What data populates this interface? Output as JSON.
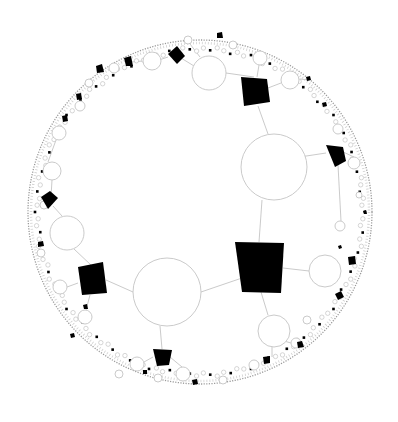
{
  "diagram": {
    "type": "hyperbolic-tree",
    "disk": {
      "cx": 200,
      "cy": 212,
      "r": 172
    },
    "colors": {
      "edge": "#bdbdbd",
      "circle_stroke": "#c4c4c4",
      "square_fill": "#000000",
      "background": "#ffffff"
    },
    "circles": [
      {
        "id": "c-main-center",
        "x": 167,
        "y": 292,
        "r": 34
      },
      {
        "id": "c-main-upper",
        "x": 274,
        "y": 167,
        "r": 33
      },
      {
        "id": "c-left",
        "x": 67,
        "y": 233,
        "r": 17
      },
      {
        "id": "c-right",
        "x": 325,
        "y": 271,
        "r": 16
      },
      {
        "id": "c-bottom-right",
        "x": 274,
        "y": 331,
        "r": 16
      },
      {
        "id": "c-top",
        "x": 209,
        "y": 73,
        "r": 17
      },
      {
        "id": "c-top-left",
        "x": 152,
        "y": 61,
        "r": 9
      },
      {
        "id": "c-top-right",
        "x": 290,
        "y": 80,
        "r": 9
      },
      {
        "id": "c-top-right2",
        "x": 260,
        "y": 58,
        "r": 7
      },
      {
        "id": "c-left-mid",
        "x": 52,
        "y": 171,
        "r": 9
      },
      {
        "id": "c-left-top",
        "x": 59,
        "y": 133,
        "r": 7
      },
      {
        "id": "c-left-low",
        "x": 60,
        "y": 287,
        "r": 7
      },
      {
        "id": "c-left-low2",
        "x": 85,
        "y": 317,
        "r": 7
      },
      {
        "id": "c-bot-left",
        "x": 137,
        "y": 364,
        "r": 7
      },
      {
        "id": "c-bot-mid",
        "x": 183,
        "y": 374,
        "r": 7
      },
      {
        "id": "c-right-up",
        "x": 354,
        "y": 163,
        "r": 6
      },
      {
        "id": "c-right-low",
        "x": 340,
        "y": 226,
        "r": 5
      },
      {
        "id": "c-r-a",
        "x": 338,
        "y": 129,
        "r": 5
      },
      {
        "id": "c-r-b",
        "x": 296,
        "y": 343,
        "r": 5
      },
      {
        "id": "c-r-c",
        "x": 254,
        "y": 365,
        "r": 5
      },
      {
        "id": "c-t-a",
        "x": 114,
        "y": 68,
        "r": 5
      },
      {
        "id": "c-t-b",
        "x": 89,
        "y": 83,
        "r": 4
      },
      {
        "id": "c-t-c",
        "x": 80,
        "y": 106,
        "r": 5
      },
      {
        "id": "c-t-d",
        "x": 188,
        "y": 40,
        "r": 4
      },
      {
        "id": "c-t-e",
        "x": 233,
        "y": 45,
        "r": 4
      },
      {
        "id": "c-l-a",
        "x": 44,
        "y": 205,
        "r": 4
      },
      {
        "id": "c-l-b",
        "x": 41,
        "y": 253,
        "r": 4
      },
      {
        "id": "c-b-a",
        "x": 119,
        "y": 374,
        "r": 4
      },
      {
        "id": "c-b-b",
        "x": 158,
        "y": 378,
        "r": 4
      },
      {
        "id": "c-b-c",
        "x": 223,
        "y": 380,
        "r": 4
      },
      {
        "id": "c-b-d",
        "x": 307,
        "y": 320,
        "r": 4
      },
      {
        "id": "c-r-d",
        "x": 359,
        "y": 195,
        "r": 3
      }
    ],
    "squares": [
      {
        "id": "sq-center",
        "points": "235,242 284,243 281,293 242,292"
      },
      {
        "id": "sq-top",
        "points": "241,77 267,79 270,102 244,106"
      },
      {
        "id": "sq-left",
        "points": "78,267 103,262 107,293 82,295"
      },
      {
        "id": "sq-right-up",
        "points": "326,145 343,147 346,161 335,167"
      },
      {
        "id": "sq-bottom",
        "points": "153,349 172,350 169,365 157,366"
      },
      {
        "id": "sq-top-left",
        "points": "168,54 177,46 185,56 177,64"
      },
      {
        "id": "sq-left-top",
        "points": "41,197 50,191 58,198 48,209"
      },
      {
        "id": "sq-top-mid",
        "points": "124,58 131,56 133,66 126,66"
      },
      {
        "id": "sq-t-a",
        "points": "96,66 102,64 104,72 97,73"
      },
      {
        "id": "sq-t-b",
        "points": "76,94 81,93 82,99 77,100"
      },
      {
        "id": "sq-t-c",
        "points": "62,116 67,115 68,121 63,122"
      },
      {
        "id": "sq-t-d",
        "points": "217,33 222,32 223,38 217,38"
      },
      {
        "id": "sq-l-a",
        "points": "38,242 43,241 44,246 38,247"
      },
      {
        "id": "sq-right-mid",
        "points": "348,257 355,256 356,264 349,265"
      },
      {
        "id": "sq-right-low",
        "points": "335,294 341,291 344,297 338,300"
      },
      {
        "id": "sq-br-a",
        "points": "297,342 302,341 304,347 298,348"
      },
      {
        "id": "sq-br-b",
        "points": "263,357 270,356 270,363 264,364"
      },
      {
        "id": "sq-bl-a",
        "points": "83,305 87,304 88,309 84,309"
      },
      {
        "id": "sq-bl-b",
        "points": "70,334 74,333 75,337 71,338"
      },
      {
        "id": "sq-b-a",
        "points": "192,380 197,379 198,384 193,385"
      },
      {
        "id": "sq-b-b",
        "points": "143,370 147,370 147,374 143,374"
      },
      {
        "id": "sq-r-a",
        "points": "306,77 310,76 311,80 307,81"
      },
      {
        "id": "sq-r-b",
        "points": "322,103 326,102 327,106 323,107"
      },
      {
        "id": "sq-r-c",
        "points": "363,211 366,210 367,214 364,214"
      },
      {
        "id": "sq-r-d",
        "points": "338,246 341,245 342,248 339,249"
      }
    ],
    "edges": [
      [
        201,
        292,
        242,
        278
      ],
      [
        259,
        242,
        262,
        200
      ],
      [
        133,
        292,
        106,
        280
      ],
      [
        283,
        268,
        309,
        271
      ],
      [
        261,
        292,
        268,
        315
      ],
      [
        268,
        134,
        258,
        106
      ],
      [
        254,
        77,
        226,
        73
      ],
      [
        268,
        88,
        281,
        83
      ],
      [
        257,
        77,
        259,
        65
      ],
      [
        280,
        160,
        326,
        153
      ],
      [
        160,
        326,
        162,
        349
      ],
      [
        92,
        266,
        74,
        249
      ],
      [
        78,
        283,
        67,
        287
      ],
      [
        90,
        295,
        86,
        310
      ],
      [
        62,
        216,
        53,
        206
      ],
      [
        194,
        66,
        181,
        58
      ],
      [
        200,
        57,
        190,
        44
      ],
      [
        51,
        197,
        52,
        180
      ],
      [
        48,
        162,
        56,
        140
      ],
      [
        300,
        79,
        309,
        80
      ],
      [
        341,
        151,
        354,
        157
      ],
      [
        338,
        165,
        341,
        221
      ],
      [
        170,
        357,
        182,
        367
      ],
      [
        153,
        357,
        144,
        362
      ],
      [
        168,
        57,
        159,
        60
      ],
      [
        143,
        61,
        131,
        62
      ],
      [
        272,
        347,
        272,
        357
      ],
      [
        284,
        341,
        298,
        345
      ]
    ],
    "labels": []
  }
}
